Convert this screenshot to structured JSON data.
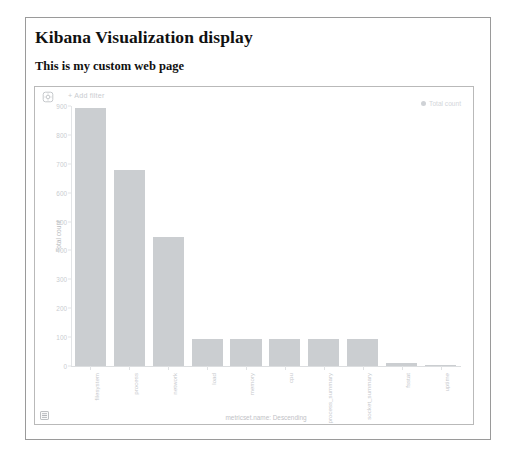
{
  "page": {
    "title": "Kibana Visualization display",
    "subtitle": "This is my custom web page"
  },
  "panel": {
    "gear_icon": "gear-icon",
    "add_filter_label": "+ Add filter",
    "panel_type_icon": "panel-grid-icon"
  },
  "legend": {
    "position": "top-right",
    "entries": [
      {
        "label": "Total count",
        "color": "#cfd2d6"
      }
    ]
  },
  "colors": {
    "bar": "#cbced1",
    "axis": "#dcdee0",
    "axis_text": "#c5c8cc",
    "frame": "#9a9a9a",
    "panel_border": "#b9b9b9"
  },
  "chart_data": {
    "type": "bar",
    "title": "",
    "xlabel": "metricset.name: Descending",
    "ylabel": "Total count",
    "ylim": [
      0,
      900
    ],
    "yticks": [
      0,
      100,
      200,
      300,
      400,
      500,
      600,
      700,
      800,
      900
    ],
    "grid": false,
    "legend": "top-right",
    "categories": [
      "filesystem",
      "process",
      "network",
      "load",
      "memory",
      "cpu",
      "process_summary",
      "socket_summary",
      "fsstat",
      "uptime"
    ],
    "series": [
      {
        "name": "Total count",
        "values": [
          893,
          678,
          447,
          95,
          95,
          95,
          95,
          95,
          12,
          1
        ]
      }
    ]
  }
}
